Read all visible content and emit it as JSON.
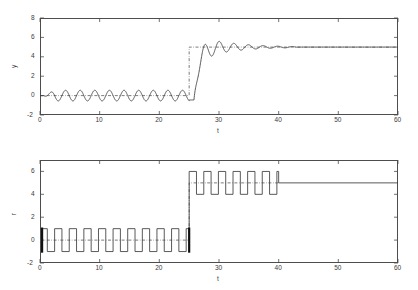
{
  "figure": {
    "background": "#ffffff",
    "axis_color": "#4d4d4d",
    "trace_color": "#3c3c3c",
    "ref_color": "#5a5a5a"
  },
  "chart_data": [
    {
      "id": "top",
      "type": "line",
      "title": "",
      "xlabel": "t",
      "ylabel": "y",
      "xlim": [
        0,
        60
      ],
      "ylim": [
        -2,
        8
      ],
      "xticks": [
        0,
        10,
        20,
        30,
        40,
        50,
        60
      ],
      "yticks": [
        -2,
        0,
        2,
        4,
        6,
        8
      ],
      "xticklabels": [
        "0",
        "10",
        "20",
        "30",
        "40",
        "50",
        "60"
      ],
      "yticklabels": [
        "-2",
        "0",
        "2",
        "4",
        "6",
        "8"
      ],
      "grid": false,
      "legend": "none",
      "series": [
        {
          "name": "output y",
          "style": "solid",
          "description": "Small-amplitude oscillation about 0 until t=25, then step response overshooting to about 6.4 near t=27.5, damped ringing about 5 that settles near t=43, constant 5 thereafter.",
          "segments": [
            {
              "kind": "damped_sine",
              "t_start": 0.0,
              "t_end": 25.0,
              "offset": 0.0,
              "amplitude": 0.55,
              "period": 2.45,
              "phase_deg": 180,
              "ramp_in_until": 2.5
            },
            {
              "kind": "step_response",
              "t_start": 25.0,
              "t_end": 60.0,
              "final_value": 5.0,
              "start_value": -0.45,
              "dead_time": 0.8,
              "rise_time": 2.0,
              "peak_value": 6.42,
              "peak_time": 27.6,
              "ring_period": 2.45,
              "decay_time_constant": 5.2,
              "settle_time": 43.0
            }
          ]
        },
        {
          "name": "reference y",
          "style": "dashdot",
          "description": "Reference level 0 for t in [0,25], jumps vertically to 5 at t=25 and stays at 5 to t=60.",
          "points": [
            [
              0,
              0
            ],
            [
              25,
              0
            ],
            [
              25,
              5
            ],
            [
              60,
              5
            ]
          ]
        }
      ]
    },
    {
      "id": "bottom",
      "type": "line",
      "title": "",
      "xlabel": "t",
      "ylabel": "r",
      "xlim": [
        0,
        60
      ],
      "ylim": [
        -2,
        7
      ],
      "xticks": [
        0,
        10,
        20,
        30,
        40,
        50,
        60
      ],
      "yticks": [
        -2,
        0,
        2,
        4,
        6
      ],
      "xticklabels": [
        "0",
        "10",
        "20",
        "30",
        "40",
        "50",
        "60"
      ],
      "yticklabels": [
        "-2",
        "0",
        "2",
        "4",
        "6"
      ],
      "grid": false,
      "legend": "none",
      "series": [
        {
          "name": "control r",
          "style": "solid",
          "description": "Square wave between +1 and -1 about 0 for t in [0,25], then square wave between 6 and 4 about 5 for t in [25,40], then constant 5 to t=60.",
          "squarewave_phase_1": {
            "t_start": 0.0,
            "t_end": 25.0,
            "high": 1.0,
            "low": -1.0,
            "period": 2.45,
            "duty": 0.5,
            "start_level": "high"
          },
          "squarewave_phase_2": {
            "t_start": 25.0,
            "t_end": 40.0,
            "high": 6.0,
            "low": 4.0,
            "period": 2.45,
            "duty": 0.5,
            "start_level": "high"
          },
          "constant_phase": {
            "t_start": 40.0,
            "t_end": 60.0,
            "value": 5.0
          }
        },
        {
          "name": "reference r",
          "style": "dashdot",
          "description": "Reference level 0 for t in [0,25], steps to 5 at t=25, constant 5 until t=40.",
          "points": [
            [
              0,
              0
            ],
            [
              25,
              0
            ],
            [
              25,
              5
            ],
            [
              40,
              5
            ]
          ]
        },
        {
          "name": "switch markers",
          "style": "thick-vertical",
          "description": "Heavy vertical bars marking the switching instants.",
          "markers": [
            {
              "t": 0.35,
              "y_from": -1.1,
              "y_to": 1.1
            },
            {
              "t": 25.0,
              "y_from": -1.1,
              "y_to": 1.1
            }
          ]
        }
      ]
    }
  ]
}
